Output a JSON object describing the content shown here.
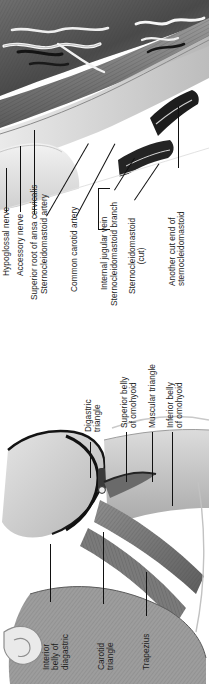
{
  "plate": {
    "title": "Triangles of the neck",
    "orientation": "rotated-90-ccw",
    "ink_color": "#1c1c1c",
    "leader_color": "#111111",
    "background": "#ffffff"
  },
  "panels": [
    {
      "id": "upper",
      "name": "deep-dissection-of-carotid-region",
      "labels": [
        {
          "id": "hypoglossal-nerve",
          "lines": [
            "Hypoglossal nerve"
          ]
        },
        {
          "id": "accessory-nerve",
          "lines": [
            "Accessory nerve"
          ]
        },
        {
          "id": "superior-root-ansa",
          "lines": [
            "Superior root of ansa cervicalis"
          ]
        },
        {
          "id": "sternocleidomastoid-artery",
          "lines": [
            "Sternocleidomastoid artery"
          ]
        },
        {
          "id": "common-carotid-artery",
          "lines": [
            "Common carotid artery"
          ]
        },
        {
          "id": "internal-jugular-vein",
          "lines": [
            "Internal jugular vein"
          ]
        },
        {
          "id": "sternocleidomastoid-branch",
          "lines": [
            "Sternocleidomastoid branch"
          ]
        },
        {
          "id": "sternocleidomastoid-cut",
          "lines": [
            "Sternocleidomastoid",
            "(cut)"
          ]
        },
        {
          "id": "another-cut-end",
          "lines": [
            "Another cut end of",
            "sternocleidomastoid"
          ]
        }
      ]
    },
    {
      "id": "lower",
      "name": "triangles-of-the-neck-overview",
      "labels": [
        {
          "id": "digastric-triangle",
          "lines": [
            "Digastric",
            "triangle"
          ]
        },
        {
          "id": "superior-belly-omohyoid",
          "lines": [
            "Superior belly",
            "of omohyoid"
          ]
        },
        {
          "id": "muscular-triangle",
          "lines": [
            "Muscular triangle"
          ]
        },
        {
          "id": "inferior-belly-omohyoid",
          "lines": [
            "Inferior belly",
            "of omohyoid"
          ]
        },
        {
          "id": "interior-belly-diagastric",
          "lines": [
            "Interior",
            "belly of",
            "diagastric"
          ]
        },
        {
          "id": "carotid-triangle",
          "lines": [
            "Carotid",
            "triangle"
          ]
        },
        {
          "id": "trapezius",
          "lines": [
            "Trapezius"
          ]
        }
      ]
    }
  ]
}
